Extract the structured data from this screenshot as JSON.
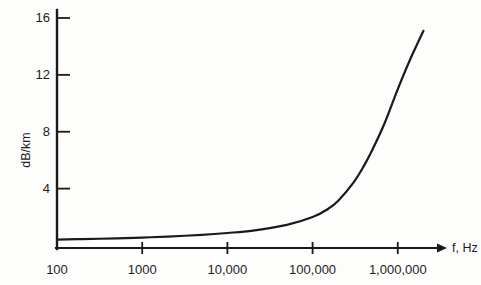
{
  "chart_data": {
    "type": "line",
    "title": "",
    "subtitle": "",
    "xlabel": "f, Hz",
    "ylabel": "dB/km",
    "xscale": "log",
    "yscale": "linear",
    "xlim": [
      100,
      2500000
    ],
    "ylim": [
      0,
      17
    ],
    "grid": false,
    "legend": null,
    "xticks": [
      {
        "value": 100,
        "label": "100"
      },
      {
        "value": 1000,
        "label": "1000"
      },
      {
        "value": 10000,
        "label": "10,000"
      },
      {
        "value": 100000,
        "label": "100,000"
      },
      {
        "value": 1000000,
        "label": "1,000,000"
      }
    ],
    "yticks": [
      {
        "value": 4,
        "label": "4"
      },
      {
        "value": 8,
        "label": "8"
      },
      {
        "value": 12,
        "label": "12"
      },
      {
        "value": 16,
        "label": "16"
      }
    ],
    "series": [
      {
        "name": "attenuation",
        "color": "#1a1a1a",
        "x": [
          100,
          200,
          500,
          1000,
          2000,
          5000,
          10000,
          20000,
          50000,
          100000,
          150000,
          200000,
          300000,
          400000,
          500000,
          700000,
          1000000,
          1400000,
          2000000
        ],
        "y": [
          0.42,
          0.45,
          0.5,
          0.56,
          0.63,
          0.75,
          0.88,
          1.05,
          1.45,
          2.0,
          2.55,
          3.15,
          4.4,
          5.6,
          6.7,
          8.6,
          11.0,
          13.1,
          15.1
        ]
      }
    ],
    "annotations": []
  },
  "axis_label_x": "f, Hz",
  "axis_label_y": "dB/km",
  "style": {
    "ink": "#1a1a1a",
    "paper": "#fdfdfc"
  }
}
